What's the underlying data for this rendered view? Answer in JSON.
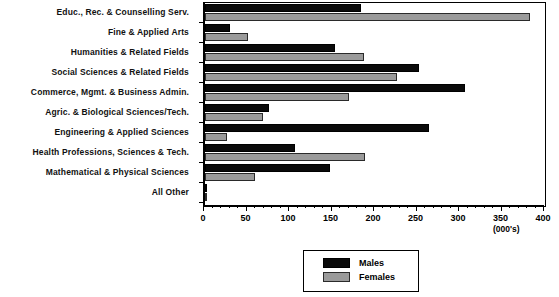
{
  "chart_data": {
    "type": "bar",
    "orientation": "horizontal",
    "title": "",
    "xlabel": "(000's)",
    "ylabel": "",
    "xlim": [
      0,
      400
    ],
    "xticks": [
      0,
      50,
      100,
      150,
      200,
      250,
      300,
      350,
      400
    ],
    "minor_tick_step": 10,
    "grid": false,
    "legend_position": "bottom-center",
    "categories": [
      "Educ., Rec. & Counselling Serv.",
      "Fine & Applied Arts",
      "Humanities & Related Fields",
      "Social Sciences & Related Fields",
      "Commerce, Mgmt. & Business Admin.",
      "Agric. & Biological Sciences/Tech.",
      "Engineering & Applied Sciences",
      "Health Professions, Sciences & Tech.",
      "Mathematical & Physical Sciences",
      "All Other"
    ],
    "series": [
      {
        "name": "Males",
        "color": "#0a0a0a",
        "values": [
          183,
          29,
          153,
          252,
          306,
          75,
          263,
          106,
          147,
          2
        ]
      },
      {
        "name": "Females",
        "color": "#9a9a9a",
        "values": [
          382,
          50,
          187,
          226,
          169,
          68,
          26,
          188,
          59,
          2
        ]
      }
    ]
  },
  "axis": {
    "units_label": "(000's)"
  },
  "legend": {
    "entries": [
      {
        "label": "Males",
        "swatch": "males"
      },
      {
        "label": "Females",
        "swatch": "females"
      }
    ]
  }
}
